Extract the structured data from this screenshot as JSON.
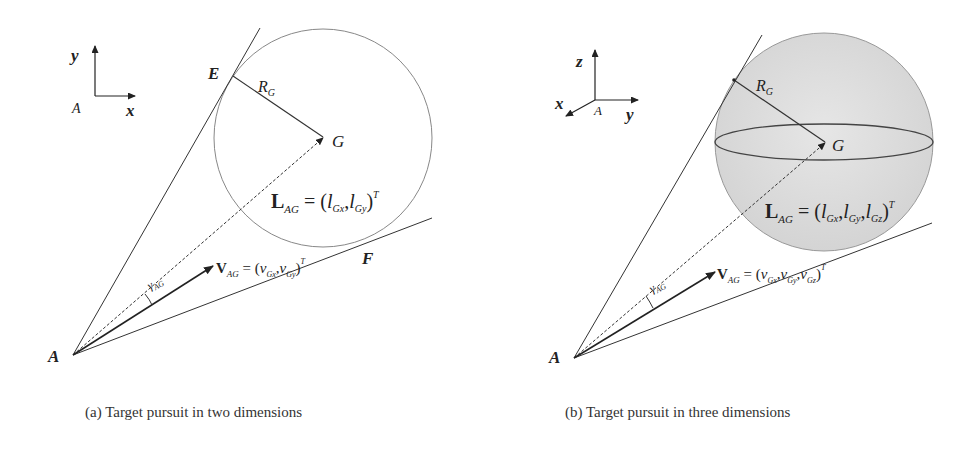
{
  "figure": {
    "panels": [
      {
        "id": "a",
        "caption": "(a) Target pursuit in two dimensions",
        "axes": {
          "origin": "A",
          "vertical": "y",
          "horizontal": "x"
        },
        "points": {
          "A": "A",
          "E": "E",
          "F": "F",
          "G": "G"
        },
        "radius_label": {
          "main": "R",
          "sub": "G"
        },
        "L_vector": {
          "main": "L",
          "sub": "AG",
          "eq": " = (",
          "c1": "l",
          "c1s": "Gx",
          "sep": ",",
          "c2": "l",
          "c2s": "Gy",
          "close": ")",
          "sup": "T"
        },
        "V_vector": {
          "main": "V",
          "sub": "AG",
          "eq": " = (",
          "c1": "v",
          "c1s": "Gx",
          "sep": ",",
          "c2": "v",
          "c2s": "Gy",
          "close": ")",
          "sup": "T"
        },
        "angle_label": {
          "main": "γ",
          "sub": "AG"
        }
      },
      {
        "id": "b",
        "caption": "(b) Target pursuit in three dimensions",
        "axes": {
          "origin": "A",
          "vertical": "z",
          "horizontal": "y",
          "diagonal": "x"
        },
        "points": {
          "A": "A",
          "G": "G"
        },
        "radius_label": {
          "main": "R",
          "sub": "G"
        },
        "L_vector": {
          "main": "L",
          "sub": "AG",
          "eq": " = (",
          "c1": "l",
          "c1s": "Gx",
          "sep": ",",
          "c2": "l",
          "c2s": "Gy",
          "c3": "l",
          "c3s": "Gz",
          "close": ")",
          "sup": "T"
        },
        "V_vector": {
          "main": "V",
          "sub": "AG",
          "eq": " = (",
          "c1": "v",
          "c1s": "Gx",
          "sep": ",",
          "c2": "v",
          "c2s": "Gy",
          "c3": "v",
          "c3s": "Gz",
          "close": ")",
          "sup": "T"
        },
        "angle_label": {
          "main": "γ",
          "sub": "AG"
        }
      }
    ],
    "colors": {
      "line": "#333333",
      "circle": "#888888",
      "sphere_fill": "#dcdcdc"
    }
  }
}
